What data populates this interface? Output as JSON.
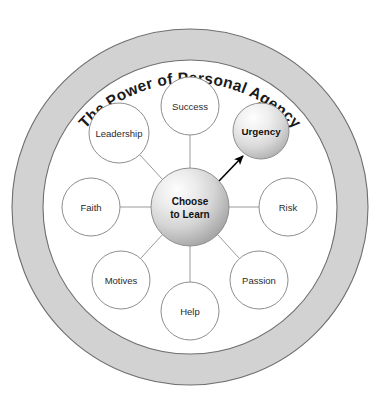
{
  "diagram": {
    "title": "The Power of Personal Agency",
    "hub": {
      "name": "choose-to-learn",
      "line1": "Choose",
      "line2": "to Learn",
      "style": "sphere-gradient",
      "cx": 190,
      "cy": 207,
      "r": 39
    },
    "highlight": {
      "name": "urgency",
      "label": "Urgency",
      "style": "sphere-gradient",
      "cx": 261,
      "cy": 131,
      "r": 28,
      "connector": "arrow"
    },
    "nodes": [
      {
        "name": "success",
        "label": "Success",
        "cx": 190,
        "cy": 106,
        "r": 29,
        "style": "plain",
        "connector": "line"
      },
      {
        "name": "leadership",
        "label": "Leadership",
        "cx": 119,
        "cy": 133,
        "r": 30,
        "style": "plain",
        "connector": "line"
      },
      {
        "name": "faith",
        "label": "Faith",
        "cx": 91,
        "cy": 207,
        "r": 29,
        "style": "plain",
        "connector": "line"
      },
      {
        "name": "motives",
        "label": "Motives",
        "cx": 121,
        "cy": 280,
        "r": 29,
        "style": "plain",
        "connector": "line"
      },
      {
        "name": "help",
        "label": "Help",
        "cx": 190,
        "cy": 311,
        "r": 29,
        "style": "plain",
        "connector": "line"
      },
      {
        "name": "passion",
        "label": "Passion",
        "cx": 259,
        "cy": 280,
        "r": 29,
        "style": "plain",
        "connector": "line"
      },
      {
        "name": "risk",
        "label": "Risk",
        "cx": 288,
        "cy": 207,
        "r": 29,
        "style": "plain",
        "connector": "line"
      }
    ],
    "ring": {
      "cx": 190,
      "cy": 207,
      "outer_r": 178,
      "inner_r": 147,
      "band_color": "#d2d2d2",
      "outline_color": "#6f6f6f"
    },
    "colors": {
      "background": "#ffffff",
      "ring_band": "#d2d2d2",
      "ring_outline": "#6f6f6f",
      "node_outline": "#8e8e8e",
      "spoke": "#9a9a9a",
      "text": "#2b2b2b",
      "text_bold": "#111111",
      "arrow": "#000000",
      "sphere_light": "#f6f6f6",
      "sphere_dark": "#a8a8a8"
    }
  }
}
